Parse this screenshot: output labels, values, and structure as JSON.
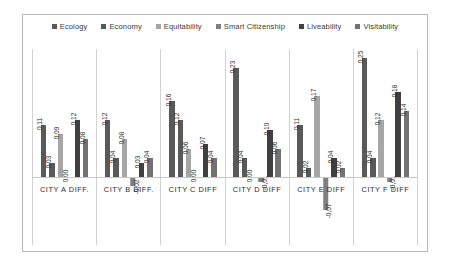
{
  "chart_data": {
    "type": "bar",
    "title": "",
    "xlabel": "",
    "ylabel": "",
    "grid": false,
    "legend_position": "top",
    "categories": [
      "CITY A DIFF.",
      "CITY B DIFF.",
      "CITY C DIFF",
      "CITY D DIFF",
      "CITY E DIFF",
      "CITY F DIFF"
    ],
    "ylim": [
      -0.08,
      0.27
    ],
    "series": [
      {
        "name": "Ecology",
        "color": "#595959",
        "values": [
          0.11,
          0.12,
          0.16,
          0.23,
          0.11,
          0.25
        ],
        "labels": [
          "0,11",
          "0,12",
          "0,16",
          "0,23",
          "0,11",
          "0,25"
        ]
      },
      {
        "name": "Economy",
        "color": "#595959",
        "values": [
          0.03,
          0.04,
          0.12,
          0.04,
          0.02,
          0.04
        ],
        "labels": [
          "0,03",
          "0,04",
          "0,12",
          "0,04",
          "0,02",
          "0,04"
        ]
      },
      {
        "name": "Equitability",
        "color": "#a6a6a6",
        "values": [
          0.09,
          0.08,
          0.06,
          0.0,
          0.17,
          0.12
        ],
        "labels": [
          "0,09",
          "0,08",
          "0,06",
          "0,00",
          "0,17",
          "0,12"
        ]
      },
      {
        "name": "Smart Citizenship",
        "color": "#7f7f7f",
        "values": [
          0.0,
          -0.02,
          0.0,
          -0.01,
          -0.07,
          -0.01
        ],
        "labels": [
          "0,00",
          "-0,02",
          "0,00",
          "-0,01",
          "-0,07",
          "-0,01"
        ]
      },
      {
        "name": "Liveability",
        "color": "#404040",
        "values": [
          0.12,
          0.03,
          0.07,
          0.1,
          0.04,
          0.18
        ],
        "labels": [
          "0,12",
          "0,03",
          "0,07",
          "0,10",
          "0,04",
          "0,18"
        ]
      },
      {
        "name": "Visitability",
        "color": "#737373",
        "values": [
          0.08,
          0.04,
          0.04,
          0.06,
          0.02,
          0.14
        ],
        "labels": [
          "0,08",
          "0,04",
          "0,04",
          "0,06",
          "0,02",
          "0,14"
        ]
      }
    ]
  },
  "legend": {
    "items": [
      {
        "label": "Ecology",
        "color": "#595959"
      },
      {
        "label": "Economy",
        "color": "#595959"
      },
      {
        "label": "Equitability",
        "color": "#a6a6a6"
      },
      {
        "label": "Smart Citizenship",
        "color": "#7f7f7f"
      },
      {
        "label": "Liveability",
        "color": "#404040"
      },
      {
        "label": "Visitability",
        "color": "#737373"
      }
    ]
  }
}
